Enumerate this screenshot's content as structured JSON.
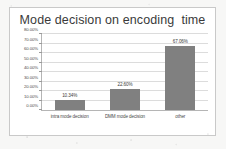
{
  "chart_data": {
    "type": "bar",
    "title": "Mode decision on encoding  time",
    "xlabel": "",
    "ylabel": "",
    "categories": [
      "intra mode decision",
      "DMM mode decision",
      "other"
    ],
    "values": [
      10.34,
      22.6,
      67.06
    ],
    "data_labels": [
      "10.34%",
      "22.60%",
      "67.06%"
    ],
    "ylim": [
      0,
      80
    ],
    "ytick_values": [
      0,
      10,
      20,
      30,
      40,
      50,
      60,
      70,
      80
    ],
    "ytick_labels": [
      "0.00%",
      "10.00%",
      "20.00%",
      "30.00%",
      "40.00%",
      "50.00%",
      "60.00%",
      "70.00%",
      "80.00%"
    ],
    "grid": true,
    "legend": false,
    "legend_position": "none",
    "series": [
      {
        "name": "encoding time share",
        "values": [
          10.34,
          22.6,
          67.06
        ],
        "color": "#808080"
      }
    ],
    "colors": {
      "bar": "#808080",
      "title_text": "#3a3a3a",
      "axis_text": "#4a4a4a",
      "gridline": "#dcdcdc",
      "axis_line": "#b5b5b5",
      "plot_background": "#ffffff",
      "frame_border": "#c9c9c9",
      "page_background": "#f7f7f6"
    }
  }
}
